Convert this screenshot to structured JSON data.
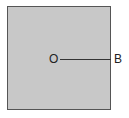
{
  "diagram": {
    "shape": "square",
    "fill_color": "#c8c8c8",
    "border_color": "#555555",
    "points": [
      {
        "label": "O",
        "position": "center"
      },
      {
        "label": "B",
        "position": "right edge midpoint"
      }
    ],
    "segments": [
      {
        "from": "O",
        "to": "B"
      }
    ]
  }
}
